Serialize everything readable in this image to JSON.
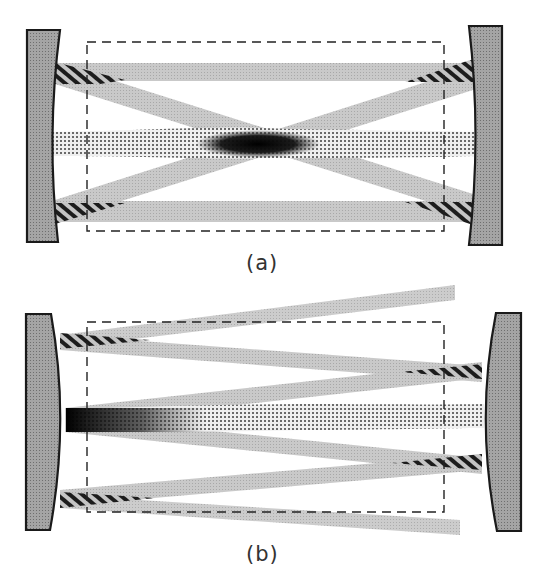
{
  "figure": {
    "panels": [
      {
        "id": "a",
        "caption": "(a)",
        "mirror_type": "concave",
        "description": "Beams cross in the center of the cavity; dotted mode beam along the axis"
      },
      {
        "id": "b",
        "caption": "(b)",
        "mirror_type": "convex",
        "description": "Beams diverge in a fan toward one end; dotted mode beam along the axis"
      }
    ],
    "legend": {
      "mirror": "mirror (gray filled)",
      "gray_beam": "light beam",
      "hatched": "reflection region at mirror",
      "dotted": "central mode beam",
      "dashed_box": "mode volume / cavity region"
    },
    "colors": {
      "mirror_fill": "#9a9a9a",
      "mirror_stroke": "#1a1a1a",
      "beam": "#c4c4c4",
      "hatch": "#1a1a1a",
      "dashed": "#222222"
    }
  }
}
